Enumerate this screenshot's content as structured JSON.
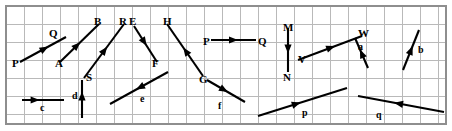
{
  "figure": {
    "kind": "vector-diagram",
    "background_color": "#ffffff",
    "grid_color": "#b9b9b9",
    "frame_color": "#8e8e8e",
    "vector_color": "#000000",
    "grid": {
      "x0": 6,
      "y0": 6,
      "x1": 446,
      "y1": 124,
      "cell": 18,
      "columns": 24,
      "rows": 6.5
    }
  },
  "vectors": [
    {
      "id": "PQ",
      "label": "P",
      "head_label": "Q",
      "tail": [
        20,
        62
      ],
      "tip": [
        66,
        37
      ],
      "arrow_at": 0.62,
      "label_pos": [
        12,
        58
      ],
      "head_label_pos": [
        49,
        28
      ]
    },
    {
      "id": "AB",
      "label": "A",
      "head_label": "B",
      "tail": [
        60,
        62
      ],
      "tip": [
        99,
        24
      ],
      "arrow_at": 0.52,
      "label_pos": [
        55,
        58
      ],
      "head_label_pos": [
        94,
        16
      ]
    },
    {
      "id": "SR",
      "label": "S",
      "head_label": "R",
      "tail": [
        84,
        78
      ],
      "tip": [
        124,
        24
      ],
      "arrow_at": 0.58,
      "label_pos": [
        86,
        72
      ],
      "head_label_pos": [
        119,
        16
      ]
    },
    {
      "id": "EF",
      "label": "E",
      "head_label": "F",
      "tail": [
        134,
        26
      ],
      "tip": [
        157,
        62
      ],
      "arrow_at": 0.55,
      "label_pos": [
        129,
        16
      ],
      "head_label_pos": [
        152,
        58
      ]
    },
    {
      "id": "GH",
      "label": "G",
      "head_label": "H",
      "tail": [
        203,
        76
      ],
      "tip": [
        167,
        24
      ],
      "arrow_at": 0.55,
      "label_pos": [
        199,
        74
      ],
      "head_label_pos": [
        163,
        16
      ]
    },
    {
      "id": "PQ2",
      "label": "P",
      "head_label": "Q",
      "tail": [
        211,
        40
      ],
      "tip": [
        256,
        40
      ],
      "arrow_at": 0.6,
      "label_pos": [
        203,
        36
      ],
      "head_label_pos": [
        258,
        36
      ]
    },
    {
      "id": "MN",
      "label": "M",
      "head_label": "N",
      "tail": [
        288,
        28
      ],
      "tip": [
        288,
        72
      ],
      "arrow_at": 0.58,
      "label_pos": [
        283,
        22
      ],
      "head_label_pos": [
        283,
        72
      ]
    },
    {
      "id": "VW",
      "label": "V",
      "head_label": "W",
      "tail": [
        298,
        60
      ],
      "tip": [
        362,
        36
      ],
      "arrow_at": 0.58,
      "label_pos": [
        298,
        54
      ],
      "head_label_pos": [
        358,
        28
      ]
    },
    {
      "id": "a",
      "label": "a",
      "head_label": "",
      "tail": [
        368,
        68
      ],
      "tip": [
        355,
        38
      ],
      "arrow_at": 0.62,
      "label_pos": [
        358,
        42
      ],
      "head_label_pos": [
        0,
        0
      ]
    },
    {
      "id": "b",
      "label": "b",
      "head_label": "",
      "tail": [
        403,
        70
      ],
      "tip": [
        419,
        30
      ],
      "arrow_at": 0.6,
      "label_pos": [
        418,
        45
      ],
      "head_label_pos": [
        0,
        0
      ]
    },
    {
      "id": "c",
      "label": "c",
      "head_label": "",
      "tail": [
        22,
        100
      ],
      "tip": [
        64,
        100
      ],
      "arrow_at": 0.42,
      "label_pos": [
        40,
        103
      ],
      "head_label_pos": [
        0,
        0
      ]
    },
    {
      "id": "d",
      "label": "d",
      "head_label": "",
      "tail": [
        82,
        118
      ],
      "tip": [
        82,
        80
      ],
      "arrow_at": 0.7,
      "label_pos": [
        72,
        91
      ],
      "head_label_pos": [
        0,
        0
      ]
    },
    {
      "id": "e",
      "label": "e",
      "head_label": "",
      "tail": [
        168,
        72
      ],
      "tip": [
        110,
        104
      ],
      "arrow_at": 0.55,
      "label_pos": [
        140,
        94
      ],
      "head_label_pos": [
        0,
        0
      ]
    },
    {
      "id": "f",
      "label": "f",
      "head_label": "",
      "tail": [
        207,
        80
      ],
      "tip": [
        245,
        102
      ],
      "arrow_at": 0.55,
      "label_pos": [
        218,
        101
      ],
      "head_label_pos": [
        0,
        0
      ]
    },
    {
      "id": "p",
      "label": "p",
      "head_label": "",
      "tail": [
        258,
        116
      ],
      "tip": [
        347,
        88
      ],
      "arrow_at": 0.48,
      "label_pos": [
        302,
        108
      ],
      "head_label_pos": [
        0,
        0
      ]
    },
    {
      "id": "q",
      "label": "q",
      "head_label": "",
      "tail": [
        444,
        112
      ],
      "tip": [
        358,
        96
      ],
      "arrow_at": 0.58,
      "label_pos": [
        376,
        110
      ],
      "head_label_pos": [
        0,
        0
      ]
    }
  ]
}
